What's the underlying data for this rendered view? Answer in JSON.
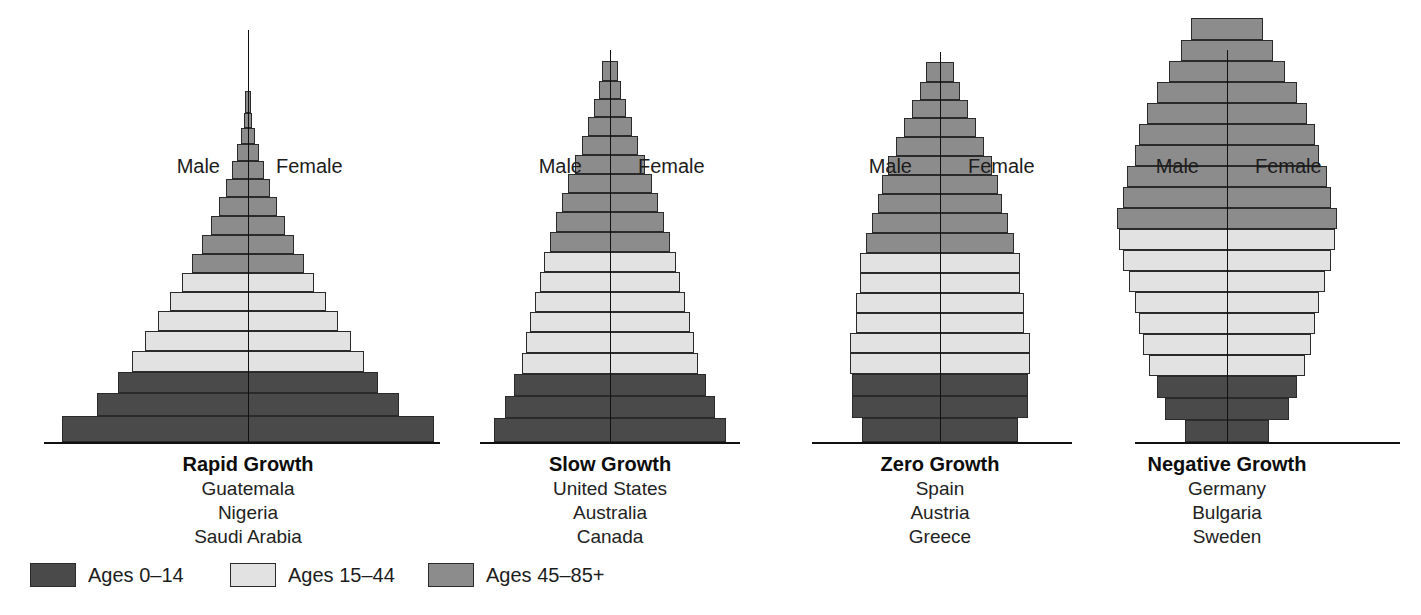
{
  "chart_data": {
    "type": "bar",
    "chart_subtype": "population-pyramid",
    "title": "",
    "xlabel": "",
    "ylabel": "",
    "grid": false,
    "legend_position": "bottom-left",
    "sides": {
      "left": "Male",
      "right": "Female"
    },
    "age_bands": [
      {
        "key": "young",
        "label": "Ages 0–14",
        "color": "#4a4a4a"
      },
      {
        "key": "middle",
        "label": "Ages 15–44",
        "color": "#e2e2e2"
      },
      {
        "key": "old",
        "label": "Ages 45–85+",
        "color": "#8c8c8c"
      }
    ],
    "note": "values are half-widths in px per side, bottom cohort first",
    "panels": [
      {
        "title": "Rapid Growth",
        "countries": [
          "Guatemala",
          "Nigeria",
          "Saudi Arabia"
        ],
        "center_x": 248,
        "baseline_from": 44,
        "baseline_to": 440,
        "axis_top": 30,
        "bars": [
          {
            "band": "young",
            "half": 186,
            "h": 26
          },
          {
            "half": 151,
            "h": 23,
            "band": "young"
          },
          {
            "half": 130,
            "h": 21,
            "band": "young"
          },
          {
            "half": 116,
            "h": 21,
            "band": "middle"
          },
          {
            "half": 103,
            "h": 20,
            "band": "middle"
          },
          {
            "half": 90,
            "h": 20,
            "band": "middle"
          },
          {
            "half": 78,
            "h": 19,
            "band": "middle"
          },
          {
            "half": 66,
            "h": 19,
            "band": "middle"
          },
          {
            "half": 56,
            "h": 19,
            "band": "old"
          },
          {
            "half": 46,
            "h": 19,
            "band": "old"
          },
          {
            "half": 37,
            "h": 19,
            "band": "old"
          },
          {
            "half": 29,
            "h": 19,
            "band": "old"
          },
          {
            "half": 22,
            "h": 18,
            "band": "old"
          },
          {
            "half": 16,
            "h": 18,
            "band": "old"
          },
          {
            "half": 11,
            "h": 17,
            "band": "old"
          },
          {
            "half": 7,
            "h": 16,
            "band": "old"
          },
          {
            "half": 4,
            "h": 15,
            "band": "old"
          },
          {
            "half": 3,
            "h": 22,
            "band": "old"
          }
        ]
      },
      {
        "title": "Slow Growth",
        "countries": [
          "United States",
          "Australia",
          "Canada"
        ],
        "center_x": 610,
        "baseline_from": 480,
        "baseline_to": 740,
        "axis_top": 50,
        "bars": [
          {
            "half": 116,
            "h": 24,
            "band": "young"
          },
          {
            "half": 105,
            "h": 22,
            "band": "young"
          },
          {
            "half": 96,
            "h": 22,
            "band": "young"
          },
          {
            "half": 88,
            "h": 21,
            "band": "middle"
          },
          {
            "half": 84,
            "h": 21,
            "band": "middle"
          },
          {
            "half": 80,
            "h": 20,
            "band": "middle"
          },
          {
            "half": 75,
            "h": 20,
            "band": "middle"
          },
          {
            "half": 70,
            "h": 20,
            "band": "middle"
          },
          {
            "half": 66,
            "h": 20,
            "band": "middle"
          },
          {
            "half": 60,
            "h": 20,
            "band": "old"
          },
          {
            "half": 54,
            "h": 20,
            "band": "old"
          },
          {
            "half": 48,
            "h": 19,
            "band": "old"
          },
          {
            "half": 42,
            "h": 19,
            "band": "old"
          },
          {
            "half": 35,
            "h": 19,
            "band": "old"
          },
          {
            "half": 28,
            "h": 19,
            "band": "old"
          },
          {
            "half": 22,
            "h": 19,
            "band": "old"
          },
          {
            "half": 16,
            "h": 18,
            "band": "old"
          },
          {
            "half": 11,
            "h": 18,
            "band": "old"
          },
          {
            "half": 8,
            "h": 20,
            "band": "old"
          }
        ]
      },
      {
        "title": "Zero Growth",
        "countries": [
          "Spain",
          "Austria",
          "Greece"
        ],
        "center_x": 940,
        "baseline_from": 812,
        "baseline_to": 1072,
        "axis_top": 52,
        "bars": [
          {
            "half": 78,
            "h": 24,
            "band": "young"
          },
          {
            "half": 88,
            "h": 22,
            "band": "young"
          },
          {
            "half": 88,
            "h": 22,
            "band": "young"
          },
          {
            "half": 90,
            "h": 21,
            "band": "middle"
          },
          {
            "half": 90,
            "h": 20,
            "band": "middle"
          },
          {
            "half": 84,
            "h": 20,
            "band": "middle"
          },
          {
            "half": 84,
            "h": 20,
            "band": "middle"
          },
          {
            "half": 80,
            "h": 20,
            "band": "middle"
          },
          {
            "half": 80,
            "h": 20,
            "band": "middle"
          },
          {
            "half": 74,
            "h": 20,
            "band": "old"
          },
          {
            "half": 68,
            "h": 20,
            "band": "old"
          },
          {
            "half": 62,
            "h": 19,
            "band": "old"
          },
          {
            "half": 58,
            "h": 19,
            "band": "old"
          },
          {
            "half": 52,
            "h": 19,
            "band": "old"
          },
          {
            "half": 44,
            "h": 19,
            "band": "old"
          },
          {
            "half": 36,
            "h": 19,
            "band": "old"
          },
          {
            "half": 28,
            "h": 18,
            "band": "old"
          },
          {
            "half": 20,
            "h": 18,
            "band": "old"
          },
          {
            "half": 14,
            "h": 20,
            "band": "old"
          }
        ]
      },
      {
        "title": "Negative Growth",
        "countries": [
          "Germany",
          "Bulgaria",
          "Sweden"
        ],
        "center_x": 1227,
        "baseline_from": 1135,
        "baseline_to": 1400,
        "axis_top": 50,
        "bars": [
          {
            "half": 42,
            "h": 22,
            "band": "young"
          },
          {
            "half": 62,
            "h": 22,
            "band": "young"
          },
          {
            "half": 70,
            "h": 22,
            "band": "young"
          },
          {
            "half": 78,
            "h": 21,
            "band": "middle"
          },
          {
            "half": 84,
            "h": 21,
            "band": "middle"
          },
          {
            "half": 88,
            "h": 21,
            "band": "middle"
          },
          {
            "half": 92,
            "h": 21,
            "band": "middle"
          },
          {
            "half": 98,
            "h": 21,
            "band": "middle"
          },
          {
            "half": 104,
            "h": 21,
            "band": "middle"
          },
          {
            "half": 108,
            "h": 21,
            "band": "middle"
          },
          {
            "half": 110,
            "h": 21,
            "band": "old"
          },
          {
            "half": 104,
            "h": 21,
            "band": "old"
          },
          {
            "half": 100,
            "h": 21,
            "band": "old"
          },
          {
            "half": 92,
            "h": 21,
            "band": "old"
          },
          {
            "half": 88,
            "h": 21,
            "band": "old"
          },
          {
            "half": 80,
            "h": 21,
            "band": "old"
          },
          {
            "half": 70,
            "h": 21,
            "band": "old"
          },
          {
            "half": 58,
            "h": 21,
            "band": "old"
          },
          {
            "half": 46,
            "h": 21,
            "band": "old"
          },
          {
            "half": 36,
            "h": 22,
            "band": "old"
          }
        ]
      }
    ]
  }
}
